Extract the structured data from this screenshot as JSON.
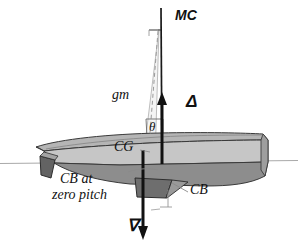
{
  "figure": {
    "kind": "naval-architecture-stability-diagram",
    "background_color": "#ffffff",
    "ink_color": "#111111"
  },
  "labels": {
    "mc": "MC",
    "gm": "gm",
    "delta": "Δ",
    "theta": "θ",
    "cg": "CG",
    "cb_at": "CB at",
    "zero_pitch": "zero pitch",
    "cb": "CB",
    "nabla": "∇"
  },
  "colors": {
    "hull_deck": "#b9b9b9",
    "hull_topside": "#c9c9c9",
    "hull_underwater": "#8e8e8e",
    "keel": "#6f6f6f",
    "rudder": "#5f5f5f",
    "waterline": "#a9a9a9",
    "wedge_fill": "#f2f2f2",
    "line": "#111111",
    "leader": "#8a8a8a"
  },
  "geometry": {
    "canvas": {
      "width": 298,
      "height": 252
    },
    "waterline": {
      "x1": 0,
      "y1": 163,
      "x2": 298,
      "y2": 160
    },
    "mc_axis": {
      "x_top": 161,
      "y_top": 8,
      "x_bottom": 162,
      "y_bottom": 163
    },
    "delta_arrow": {
      "x": 162,
      "y_tail": 163,
      "y_head": 95
    },
    "nabla_arrow": {
      "x": 143,
      "y_tail": 150,
      "y_head": 237
    },
    "mc_tick": {
      "x1": 150,
      "x2": 163,
      "y": 30
    },
    "theta_angle_deg": 7
  },
  "elements": [
    {
      "name": "metacenter-axis",
      "label": "MC"
    },
    {
      "name": "metacentric-height",
      "label": "gm"
    },
    {
      "name": "buoyancy-force",
      "label": "Δ"
    },
    {
      "name": "pitch-angle",
      "label": "θ"
    },
    {
      "name": "center-of-gravity",
      "label": "CG"
    },
    {
      "name": "center-of-buoyancy-zero-pitch",
      "label": "CB at zero pitch"
    },
    {
      "name": "center-of-buoyancy",
      "label": "CB"
    },
    {
      "name": "displacement-volume",
      "label": "∇"
    }
  ]
}
